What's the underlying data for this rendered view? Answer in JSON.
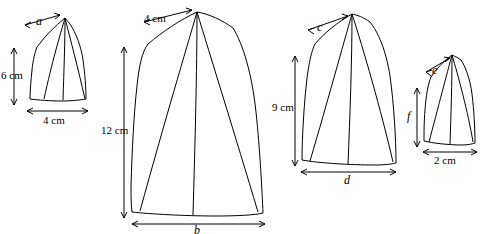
{
  "figure": {
    "type": "geometry-diagram",
    "stroke_color": "#000000",
    "background_color": "#ffffff",
    "shapes": [
      {
        "id": "tent-1",
        "labels": {
          "top_width": "a",
          "left_height": "6 cm",
          "bottom_width": "4 cm"
        }
      },
      {
        "id": "tent-2",
        "labels": {
          "top_width": "4 cm",
          "left_height": "12 cm",
          "bottom_width": "b"
        }
      },
      {
        "id": "tent-3",
        "labels": {
          "top_width": "c",
          "left_height": "9 cm",
          "bottom_width": "d"
        }
      },
      {
        "id": "tent-4",
        "labels": {
          "top_width": "e",
          "left_height": "f",
          "bottom_width": "2 cm"
        }
      }
    ]
  },
  "labels": {
    "a": "a",
    "six_cm": "6 cm",
    "four_cm_bottom_1": "4 cm",
    "four_cm_top_2": "4 cm",
    "twelve_cm": "12 cm",
    "b": "b",
    "c": "c",
    "nine_cm": "9 cm",
    "d": "d",
    "e": "e",
    "f": "f",
    "two_cm": "2 cm"
  }
}
